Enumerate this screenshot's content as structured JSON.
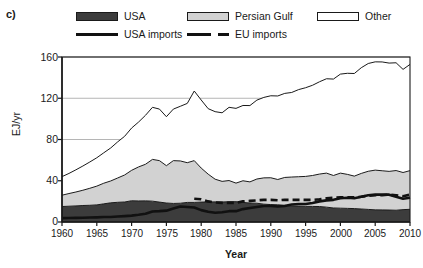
{
  "panel": {
    "label": "c)"
  },
  "legend": {
    "items": [
      {
        "name": "usa",
        "label": "USA",
        "type": "swatch",
        "fill": "#3c3c3c"
      },
      {
        "name": "persian-gulf",
        "label": "Persian Gulf",
        "type": "swatch",
        "fill": "#d2d2d2"
      },
      {
        "name": "other",
        "label": "Other",
        "type": "swatch",
        "fill": "#ffffff"
      },
      {
        "name": "usa-imports",
        "label": "USA imports",
        "type": "line",
        "dash": "solid",
        "color": "#111111"
      },
      {
        "name": "eu-imports",
        "label": "EU imports",
        "type": "line",
        "dash": "dashed",
        "color": "#111111"
      }
    ]
  },
  "axes": {
    "ylabel": "EJ/yr",
    "xlabel": "Year",
    "yticks": [
      0,
      40,
      80,
      120,
      160
    ],
    "ytick_labels": [
      "0",
      "40",
      "80",
      "120",
      "160"
    ],
    "xticks": [
      1960,
      1965,
      1970,
      1975,
      1980,
      1985,
      1990,
      1995,
      2000,
      2005,
      2010
    ],
    "xtick_labels": [
      "1960",
      "1965",
      "1970",
      "1975",
      "1980",
      "1985",
      "1990",
      "1995",
      "2000",
      "2005",
      "2010"
    ],
    "ylim": [
      0,
      160
    ],
    "xlim": [
      1960,
      2010
    ],
    "grid": "horizontal"
  },
  "chart_data": {
    "type": "area",
    "title": "",
    "subtitle": "",
    "xlabel": "Year",
    "ylabel": "EJ/yr",
    "xlim": [
      1960,
      2010
    ],
    "ylim": [
      0,
      160
    ],
    "grid": true,
    "legend_position": "top",
    "stacked": true,
    "x": [
      1960,
      1961,
      1962,
      1963,
      1964,
      1965,
      1966,
      1967,
      1968,
      1969,
      1970,
      1971,
      1972,
      1973,
      1974,
      1975,
      1976,
      1977,
      1978,
      1979,
      1980,
      1981,
      1982,
      1983,
      1984,
      1985,
      1986,
      1987,
      1988,
      1989,
      1990,
      1991,
      1992,
      1993,
      1994,
      1995,
      1996,
      1997,
      1998,
      1999,
      2000,
      2001,
      2002,
      2003,
      2004,
      2005,
      2006,
      2007,
      2008,
      2009,
      2010
    ],
    "series": [
      {
        "name": "USA",
        "type": "stacked-area",
        "fill": "#3c3c3c",
        "values": [
          15.0,
          15.3,
          15.6,
          16.0,
          16.2,
          16.6,
          17.6,
          18.6,
          19.1,
          19.4,
          20.6,
          20.4,
          20.5,
          20.2,
          19.3,
          18.4,
          18.0,
          18.2,
          19.0,
          19.0,
          19.3,
          19.4,
          19.5,
          19.4,
          19.7,
          19.7,
          19.0,
          18.4,
          18.2,
          17.3,
          16.9,
          16.7,
          16.2,
          15.6,
          15.4,
          15.2,
          15.1,
          15.0,
          14.4,
          13.6,
          13.4,
          13.2,
          13.0,
          12.6,
          12.2,
          11.8,
          11.7,
          11.6,
          11.4,
          12.0,
          12.3
        ]
      },
      {
        "name": "Persian Gulf",
        "type": "stacked-area",
        "fill": "#d2d2d2",
        "values": [
          11.0,
          12.3,
          13.5,
          14.8,
          16.5,
          18.2,
          20.0,
          21.2,
          23.6,
          26.2,
          29.5,
          33.0,
          35.5,
          40.5,
          40.2,
          36.2,
          41.5,
          41.0,
          38.5,
          40.5,
          33.0,
          27.0,
          22.0,
          20.0,
          20.5,
          18.0,
          21.0,
          20.5,
          23.5,
          25.5,
          26.0,
          24.5,
          27.0,
          28.0,
          28.5,
          29.0,
          30.0,
          31.5,
          33.0,
          31.5,
          34.0,
          33.0,
          31.5,
          34.5,
          37.0,
          38.5,
          38.0,
          37.5,
          38.5,
          36.0,
          37.5
        ]
      },
      {
        "name": "Other",
        "type": "stacked-area",
        "fill": "#ffffff",
        "values": [
          18.0,
          19.5,
          21.5,
          23.5,
          25.5,
          27.5,
          29.5,
          32.0,
          35.0,
          37.5,
          41.0,
          43.5,
          47.5,
          50.5,
          50.0,
          47.5,
          50.0,
          53.0,
          57.5,
          67.5,
          66.0,
          63.5,
          65.5,
          66.5,
          71.0,
          72.5,
          73.0,
          74.0,
          76.5,
          78.0,
          79.5,
          81.0,
          81.5,
          82.0,
          84.5,
          86.0,
          87.5,
          89.5,
          91.5,
          93.5,
          96.0,
          98.0,
          99.5,
          102.5,
          104.5,
          105.0,
          105.5,
          105.0,
          104.5,
          100.0,
          103.0
        ]
      }
    ],
    "totals": [
      44,
      47,
      50,
      54,
      58,
      62,
      67,
      72,
      78,
      83,
      91,
      97,
      104,
      111,
      110,
      102,
      110,
      112,
      115,
      127,
      118,
      110,
      107,
      106,
      111,
      110,
      113,
      113,
      118,
      121,
      122,
      122,
      125,
      126,
      128,
      130,
      133,
      136,
      139,
      139,
      143,
      144,
      144,
      150,
      154,
      155,
      155,
      154,
      154,
      148,
      153
    ],
    "lines": [
      {
        "name": "USA imports",
        "style": "solid",
        "color": "#111111",
        "width": 2.6,
        "x": [
          1960,
          1961,
          1962,
          1963,
          1964,
          1965,
          1966,
          1967,
          1968,
          1969,
          1970,
          1971,
          1972,
          1973,
          1974,
          1975,
          1976,
          1977,
          1978,
          1979,
          1980,
          1981,
          1982,
          1983,
          1984,
          1985,
          1986,
          1987,
          1988,
          1989,
          1990,
          1991,
          1992,
          1993,
          1994,
          1995,
          1996,
          1997,
          1998,
          1999,
          2000,
          2001,
          2002,
          2003,
          2004,
          2005,
          2006,
          2007,
          2008,
          2009,
          2010
        ],
        "values": [
          3.8,
          3.9,
          4.0,
          4.1,
          4.3,
          4.5,
          4.8,
          4.9,
          5.3,
          5.7,
          6.2,
          7.0,
          8.0,
          10.2,
          10.5,
          11.0,
          13.0,
          15.0,
          14.5,
          14.0,
          11.5,
          10.0,
          9.0,
          9.5,
          10.5,
          10.5,
          12.5,
          13.5,
          14.5,
          15.5,
          15.5,
          15.0,
          15.5,
          17.0,
          17.5,
          17.5,
          18.5,
          20.0,
          21.0,
          21.5,
          23.0,
          23.5,
          23.0,
          24.5,
          26.0,
          26.5,
          26.5,
          26.5,
          24.5,
          22.5,
          23.5
        ]
      },
      {
        "name": "EU imports",
        "style": "dashed",
        "color": "#111111",
        "width": 2.6,
        "x": [
          1979,
          1980,
          1981,
          1982,
          1983,
          1984,
          1985,
          1986,
          1987,
          1988,
          1989,
          1990,
          1991,
          1992,
          1993,
          1994,
          1995,
          1996,
          1997,
          1998,
          1999,
          2000,
          2001,
          2002,
          2003,
          2004,
          2005,
          2006,
          2007,
          2008,
          2009,
          2010
        ],
        "values": [
          22.5,
          22.0,
          20.0,
          19.0,
          18.5,
          18.5,
          18.5,
          20.0,
          20.5,
          21.0,
          21.5,
          21.5,
          21.0,
          21.5,
          21.5,
          21.5,
          21.5,
          21.5,
          22.0,
          23.0,
          23.5,
          24.0,
          24.0,
          24.0,
          24.5,
          25.5,
          26.0,
          26.0,
          26.5,
          26.0,
          25.0,
          26.5
        ]
      }
    ]
  },
  "colors": {
    "usa": "#3c3c3c",
    "persian_gulf": "#d2d2d2",
    "other": "#ffffff",
    "line": "#111111",
    "axis": "#1a1a1a",
    "grid": "#b5b5b5"
  }
}
